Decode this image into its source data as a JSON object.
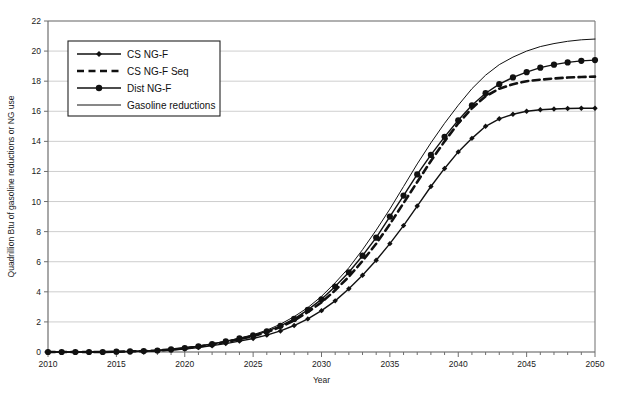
{
  "chart_data": {
    "type": "line",
    "title": "",
    "xlabel": "Year",
    "ylabel": "Quadrillion Btu of gasoline reductions or NG use",
    "xlim": [
      2010,
      2050
    ],
    "ylim": [
      0,
      22
    ],
    "ytick_step": 2,
    "xtick_step": 1,
    "xtick_label_step": 5,
    "grid": "horizontal",
    "legend_position": "upper-left-inside",
    "ytick_labels": [
      "0",
      "2",
      "4",
      "6",
      "8",
      "10",
      "12",
      "14",
      "16",
      "18",
      "20",
      "22"
    ],
    "xtick_labels": [
      "2010",
      "2015",
      "2020",
      "2025",
      "2030",
      "2035",
      "2040",
      "2045",
      "2050"
    ],
    "x": [
      2010,
      2011,
      2012,
      2013,
      2014,
      2015,
      2016,
      2017,
      2018,
      2019,
      2020,
      2021,
      2022,
      2023,
      2024,
      2025,
      2026,
      2027,
      2028,
      2029,
      2030,
      2031,
      2032,
      2033,
      2034,
      2035,
      2036,
      2037,
      2038,
      2039,
      2040,
      2041,
      2042,
      2043,
      2044,
      2045,
      2046,
      2047,
      2048,
      2049,
      2050
    ],
    "series": [
      {
        "name": "CS NG-F",
        "marker": "diamond",
        "dash": "solid",
        "color": "#111111",
        "values": [
          0.0,
          0.0,
          0.0,
          0.0,
          0.0,
          0.02,
          0.03,
          0.05,
          0.08,
          0.13,
          0.2,
          0.3,
          0.42,
          0.56,
          0.72,
          0.9,
          1.12,
          1.4,
          1.76,
          2.2,
          2.75,
          3.4,
          4.2,
          5.1,
          6.1,
          7.2,
          8.4,
          9.7,
          11.0,
          12.2,
          13.3,
          14.2,
          15.0,
          15.5,
          15.8,
          16.0,
          16.1,
          16.15,
          16.18,
          16.2,
          16.2
        ]
      },
      {
        "name": "CS NG-F Seq",
        "marker": "none",
        "dash": "dashed",
        "color": "#111111",
        "values": [
          0.0,
          0.0,
          0.0,
          0.0,
          0.0,
          0.02,
          0.04,
          0.06,
          0.1,
          0.16,
          0.25,
          0.36,
          0.5,
          0.66,
          0.85,
          1.05,
          1.32,
          1.66,
          2.1,
          2.65,
          3.3,
          4.1,
          5.0,
          6.05,
          7.2,
          8.5,
          9.9,
          11.3,
          12.7,
          14.0,
          15.2,
          16.2,
          17.0,
          17.5,
          17.8,
          18.0,
          18.1,
          18.18,
          18.24,
          18.28,
          18.3
        ]
      },
      {
        "name": "Dist NG-F",
        "marker": "circle",
        "dash": "solid",
        "color": "#111111",
        "values": [
          0.0,
          0.0,
          0.0,
          0.0,
          0.0,
          0.02,
          0.04,
          0.06,
          0.1,
          0.17,
          0.26,
          0.38,
          0.52,
          0.7,
          0.9,
          1.1,
          1.38,
          1.74,
          2.2,
          2.8,
          3.5,
          4.35,
          5.3,
          6.4,
          7.6,
          9.0,
          10.4,
          11.8,
          13.1,
          14.3,
          15.4,
          16.4,
          17.2,
          17.8,
          18.25,
          18.6,
          18.9,
          19.1,
          19.25,
          19.35,
          19.4
        ]
      },
      {
        "name": "Gasoline reductions",
        "marker": "none",
        "dash": "solid",
        "color": "#111111",
        "values": [
          0.0,
          0.0,
          0.0,
          0.0,
          0.01,
          0.02,
          0.04,
          0.07,
          0.12,
          0.19,
          0.28,
          0.4,
          0.55,
          0.72,
          0.92,
          1.15,
          1.45,
          1.85,
          2.35,
          2.95,
          3.7,
          4.6,
          5.6,
          6.8,
          8.1,
          9.5,
          11.0,
          12.5,
          13.9,
          15.2,
          16.4,
          17.5,
          18.4,
          19.1,
          19.6,
          20.0,
          20.3,
          20.5,
          20.65,
          20.75,
          20.8
        ]
      }
    ]
  },
  "legend": {
    "entries": [
      {
        "label": "CS NG-F"
      },
      {
        "label": "CS NG-F Seq"
      },
      {
        "label": "Dist NG-F"
      },
      {
        "label": "Gasoline reductions"
      }
    ]
  },
  "colors": {
    "ink": "#111111",
    "grid": "#b9b9b9",
    "frame": "#7a7a7a",
    "background": "#ffffff"
  }
}
